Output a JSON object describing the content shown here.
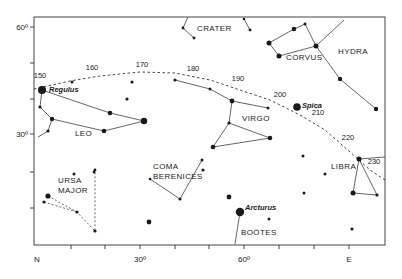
{
  "colors": {
    "ink": "#1a1a1a",
    "line": "#555555",
    "background": "#ffffff"
  },
  "frame": {
    "left": 34,
    "top": 17,
    "right": 385,
    "bottom": 245
  },
  "axes": {
    "y_labels": [
      {
        "label": "60º",
        "y": 27
      },
      {
        "label": "30º",
        "y": 134
      }
    ],
    "y_ticks": [
      27,
      63,
      99,
      134,
      172,
      208
    ],
    "x_labels": [
      {
        "label": "N",
        "x": 37
      },
      {
        "label": "30º",
        "x": 140
      },
      {
        "label": "60º",
        "x": 244
      },
      {
        "label": "E",
        "x": 349
      }
    ],
    "x_ticks": [
      71,
      105,
      140,
      175,
      209,
      244,
      279,
      314,
      349
    ]
  },
  "ecliptic": {
    "points": [
      [
        34,
        89
      ],
      [
        70,
        81
      ],
      [
        100,
        76
      ],
      [
        140,
        72
      ],
      [
        175,
        73
      ],
      [
        210,
        80
      ],
      [
        240,
        90
      ],
      [
        270,
        100
      ],
      [
        300,
        115
      ],
      [
        325,
        130
      ],
      [
        350,
        152
      ],
      [
        370,
        170
      ],
      [
        385,
        180
      ]
    ],
    "markers": [
      {
        "label": "150",
        "x": 40,
        "y": 81
      },
      {
        "label": "160",
        "x": 92,
        "y": 73
      },
      {
        "label": "170",
        "x": 142,
        "y": 70
      },
      {
        "label": "180",
        "x": 193,
        "y": 74
      },
      {
        "label": "190",
        "x": 238,
        "y": 84
      },
      {
        "label": "200",
        "x": 280,
        "y": 100
      },
      {
        "label": "210",
        "x": 318,
        "y": 118
      },
      {
        "label": "220",
        "x": 348,
        "y": 143
      },
      {
        "label": "230",
        "x": 374,
        "y": 167
      }
    ]
  },
  "constellations": [
    {
      "name": "LEO",
      "x": 75,
      "y": 136
    },
    {
      "name": "CRATER",
      "x": 197,
      "y": 31
    },
    {
      "name": "CORVUS",
      "x": 286,
      "y": 60
    },
    {
      "name": "HYDRA",
      "x": 338,
      "y": 54
    },
    {
      "name": "VIRGO",
      "x": 242,
      "y": 121
    },
    {
      "name": "COMA",
      "x": 153,
      "y": 169
    },
    {
      "name": "BERENICES",
      "x": 153,
      "y": 179
    },
    {
      "name": "URSA",
      "x": 58,
      "y": 183
    },
    {
      "name": "MAJOR",
      "x": 58,
      "y": 193
    },
    {
      "name": "LIBRA",
      "x": 331,
      "y": 169
    },
    {
      "name": "BOÖTES",
      "x": 241,
      "y": 235
    }
  ],
  "star_names": [
    {
      "name": "Regulus",
      "x": 49,
      "y": 92
    },
    {
      "name": "Spica",
      "x": 302,
      "y": 108
    },
    {
      "name": "Arcturus",
      "x": 245,
      "y": 210
    }
  ],
  "stars": [
    {
      "x": 42,
      "y": 90,
      "r": 4
    },
    {
      "x": 72,
      "y": 82,
      "r": 1.5
    },
    {
      "x": 40,
      "y": 107,
      "r": 1.6
    },
    {
      "x": 52,
      "y": 119,
      "r": 2.2
    },
    {
      "x": 48,
      "y": 131,
      "r": 1.6
    },
    {
      "x": 110,
      "y": 113,
      "r": 2.3
    },
    {
      "x": 104,
      "y": 131,
      "r": 2.3
    },
    {
      "x": 144,
      "y": 121,
      "r": 3.2
    },
    {
      "x": 132,
      "y": 82,
      "r": 1.6
    },
    {
      "x": 127,
      "y": 99,
      "r": 1.6
    },
    {
      "x": 175,
      "y": 80,
      "r": 1.6
    },
    {
      "x": 183,
      "y": 28,
      "r": 1.4
    },
    {
      "x": 194,
      "y": 38,
      "r": 1.4
    },
    {
      "x": 244,
      "y": 19,
      "r": 1.3
    },
    {
      "x": 250,
      "y": 30,
      "r": 1.4
    },
    {
      "x": 269,
      "y": 43,
      "r": 2.5
    },
    {
      "x": 279,
      "y": 56,
      "r": 2.5
    },
    {
      "x": 294,
      "y": 29,
      "r": 2.3
    },
    {
      "x": 305,
      "y": 24,
      "r": 1.5
    },
    {
      "x": 316,
      "y": 46,
      "r": 2.5
    },
    {
      "x": 340,
      "y": 79,
      "r": 2.2
    },
    {
      "x": 376,
      "y": 109,
      "r": 2.2
    },
    {
      "x": 210,
      "y": 89,
      "r": 1.5
    },
    {
      "x": 232,
      "y": 101,
      "r": 2.4
    },
    {
      "x": 268,
      "y": 108,
      "r": 1.5
    },
    {
      "x": 297,
      "y": 107,
      "r": 3.8
    },
    {
      "x": 229,
      "y": 123,
      "r": 1.6
    },
    {
      "x": 270,
      "y": 138,
      "r": 2.3
    },
    {
      "x": 213,
      "y": 147,
      "r": 2.3
    },
    {
      "x": 150,
      "y": 179,
      "r": 1.3
    },
    {
      "x": 180,
      "y": 199,
      "r": 1.6
    },
    {
      "x": 202,
      "y": 160,
      "r": 1.5
    },
    {
      "x": 149,
      "y": 222,
      "r": 2.4
    },
    {
      "x": 229,
      "y": 197,
      "r": 2.4
    },
    {
      "x": 240,
      "y": 212,
      "r": 4.2
    },
    {
      "x": 269,
      "y": 219,
      "r": 1.5
    },
    {
      "x": 74,
      "y": 174,
      "r": 1.5
    },
    {
      "x": 94,
      "y": 172,
      "r": 1.4
    },
    {
      "x": 95,
      "y": 170,
      "r": 1.4
    },
    {
      "x": 48,
      "y": 196,
      "r": 2.6
    },
    {
      "x": 44,
      "y": 202,
      "r": 1.6
    },
    {
      "x": 77,
      "y": 212,
      "r": 1.6
    },
    {
      "x": 95,
      "y": 231,
      "r": 1.6
    },
    {
      "x": 303,
      "y": 156,
      "r": 1.5
    },
    {
      "x": 325,
      "y": 174,
      "r": 1.5
    },
    {
      "x": 304,
      "y": 193,
      "r": 1.5
    },
    {
      "x": 353,
      "y": 193,
      "r": 2.5
    },
    {
      "x": 359,
      "y": 159,
      "r": 2.5
    },
    {
      "x": 377,
      "y": 195,
      "r": 1.6
    },
    {
      "x": 352,
      "y": 229,
      "r": 1.6
    },
    {
      "x": 203,
      "y": 170,
      "r": 1.6
    }
  ],
  "lines_solid": [
    [
      [
        42,
        90
      ],
      [
        110,
        113
      ],
      [
        144,
        121
      ],
      [
        104,
        131
      ],
      [
        52,
        119
      ],
      [
        40,
        107
      ],
      [
        42,
        90
      ]
    ],
    [
      [
        52,
        119
      ],
      [
        48,
        131
      ],
      [
        38,
        137
      ]
    ],
    [
      [
        188,
        17
      ],
      [
        183,
        28
      ],
      [
        194,
        38
      ]
    ],
    [
      [
        244,
        19
      ],
      [
        250,
        30
      ]
    ],
    [
      [
        269,
        43
      ],
      [
        294,
        29
      ],
      [
        305,
        24
      ],
      [
        316,
        46
      ],
      [
        279,
        56
      ],
      [
        269,
        43
      ]
    ],
    [
      [
        316,
        46
      ],
      [
        344,
        20
      ]
    ],
    [
      [
        316,
        46
      ],
      [
        340,
        79
      ],
      [
        376,
        109
      ]
    ],
    [
      [
        175,
        80
      ],
      [
        210,
        89
      ],
      [
        232,
        101
      ],
      [
        268,
        108
      ]
    ],
    [
      [
        232,
        101
      ],
      [
        229,
        123
      ],
      [
        270,
        138
      ],
      [
        213,
        147
      ],
      [
        229,
        123
      ]
    ],
    [
      [
        150,
        179
      ],
      [
        180,
        199
      ],
      [
        202,
        160
      ]
    ],
    [
      [
        240,
        212
      ],
      [
        235,
        244
      ]
    ],
    [
      [
        359,
        159
      ],
      [
        353,
        193
      ],
      [
        377,
        195
      ],
      [
        359,
        159
      ]
    ],
    [
      [
        359,
        159
      ],
      [
        385,
        157
      ]
    ]
  ],
  "lines_dashed": [
    [
      [
        48,
        196
      ],
      [
        77,
        212
      ],
      [
        95,
        231
      ],
      [
        95,
        170
      ]
    ],
    [
      [
        44,
        202
      ],
      [
        77,
        212
      ]
    ]
  ]
}
